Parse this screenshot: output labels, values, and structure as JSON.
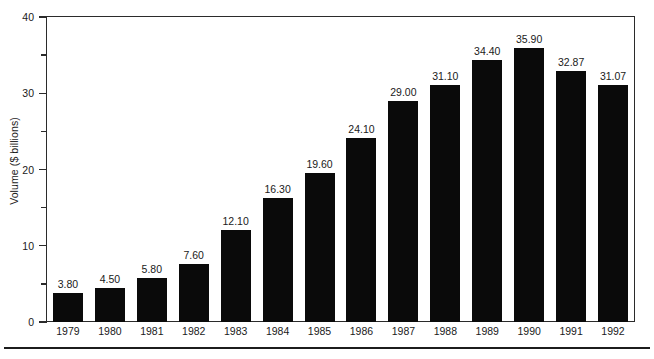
{
  "chart_data": {
    "type": "bar",
    "title": "",
    "xlabel": "",
    "ylabel": "Volume ($ billions)",
    "categories": [
      "1979",
      "1980",
      "1981",
      "1982",
      "1983",
      "1984",
      "1985",
      "1986",
      "1987",
      "1988",
      "1989",
      "1990",
      "1991",
      "1992"
    ],
    "values": [
      3.8,
      4.5,
      5.8,
      7.6,
      12.1,
      16.3,
      19.6,
      24.1,
      29.0,
      31.1,
      34.4,
      35.9,
      32.87,
      31.07
    ],
    "value_labels": [
      "3.80",
      "4.50",
      "5.80",
      "7.60",
      "12.10",
      "16.30",
      "19.60",
      "24.10",
      "29.00",
      "31.10",
      "34.40",
      "35.90",
      "32.87",
      "31.07"
    ],
    "ylim": [
      0,
      40
    ],
    "y_major_ticks": [
      0,
      10,
      20,
      30,
      40
    ],
    "y_major_tick_labels": [
      "0",
      "10",
      "20",
      "30",
      "40"
    ],
    "y_minor_ticks": [
      5,
      15,
      25,
      35
    ],
    "grid": false,
    "legend": null,
    "bar_color": "#0a0a0a",
    "axis_color": "#2b2b2b",
    "background": "#ffffff"
  }
}
